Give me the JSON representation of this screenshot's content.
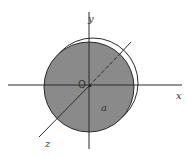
{
  "diagram": {
    "type": "3D coordinate system with circular disk",
    "labels": {
      "x_axis": "x",
      "y_axis": "y",
      "z_axis": "z",
      "origin": "O",
      "radius": "a"
    },
    "colors": {
      "disk_fill": "#8a8a8a",
      "axis_stroke": "#2a2a2a",
      "background": "#ffffff",
      "rim_highlight": "#ffffff"
    },
    "geometry": {
      "center": [
        89,
        86
      ],
      "disk_radius": 45
    }
  }
}
